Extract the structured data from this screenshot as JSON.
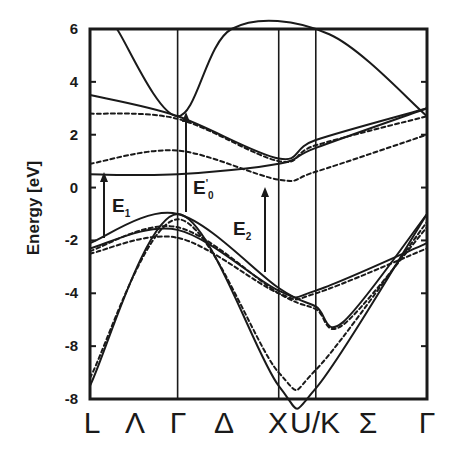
{
  "chart_data": {
    "type": "line",
    "title": "",
    "xlabel": "",
    "ylabel": "Energy  [eV]",
    "ylim": [
      -8,
      6
    ],
    "y_ticks": [
      6,
      4,
      2,
      0,
      -2,
      -4,
      -6,
      -8
    ],
    "y_tick_labels": [
      "6",
      "4",
      "2",
      "0",
      "-2",
      "-4",
      "-8",
      "-8"
    ],
    "x_tick_labels": [
      "L",
      "Λ",
      "Γ",
      "Δ",
      "X",
      "U/K",
      "Σ",
      "Γ"
    ],
    "high_symmetry_points": [
      {
        "label": "L",
        "x": 0.0
      },
      {
        "label": "Γ",
        "x": 0.26
      },
      {
        "label": "X",
        "x": 0.56
      },
      {
        "label": "U/K",
        "x": 0.67
      },
      {
        "label": "Γ",
        "x": 1.0
      }
    ],
    "grid": false,
    "legend": null,
    "line_styles": [
      "solid",
      "dashed"
    ],
    "annotations": [
      {
        "text": "E",
        "sub": "1",
        "sup": "",
        "note": "upward arrow transition near L-Λ, from about -2 to 0.6 eV"
      },
      {
        "text": "E",
        "sub": "0",
        "sup": "'",
        "note": "upward arrow transition at Γ, from about -1 to 2 eV"
      },
      {
        "text": "E",
        "sub": "2",
        "sup": "",
        "note": "upward arrow transition near Δ-X, from about -3.8 to 0.9 eV"
      }
    ],
    "series": [
      {
        "name": "valence band 1 (solid)",
        "style": "solid",
        "x": [
          0.0,
          0.26,
          0.56,
          0.67,
          1.0
        ],
        "values": [
          -7.5,
          -1.0,
          -7.5,
          -7.6,
          -1.0
        ]
      },
      {
        "name": "valence band 1 (dashed)",
        "style": "dashed",
        "x": [
          0.0,
          0.26,
          0.56,
          0.67,
          1.0
        ],
        "values": [
          -7.2,
          -1.2,
          -7.0,
          -6.9,
          -1.3
        ]
      },
      {
        "name": "valence band 2 (solid)",
        "style": "solid",
        "x": [
          0.0,
          0.26,
          0.56,
          0.67,
          0.75,
          1.0
        ],
        "values": [
          -2.1,
          -1.0,
          -3.8,
          -4.5,
          -5.1,
          -1.0
        ]
      },
      {
        "name": "valence band 2 (dashed)",
        "style": "dashed",
        "x": [
          0.0,
          0.26,
          0.56,
          0.67,
          0.75,
          1.0
        ],
        "values": [
          -2.4,
          -1.5,
          -4.0,
          -4.6,
          -5.2,
          -1.5
        ]
      },
      {
        "name": "valence band 3 (solid)",
        "style": "solid",
        "x": [
          0.0,
          0.26,
          0.56,
          0.67,
          1.0
        ],
        "values": [
          -2.3,
          -1.6,
          -3.9,
          -3.9,
          -2.1
        ]
      },
      {
        "name": "valence band 3 (dashed)",
        "style": "dashed",
        "x": [
          0.0,
          0.26,
          0.56,
          0.67,
          1.0
        ],
        "values": [
          -2.5,
          -1.9,
          -4.0,
          -4.0,
          -2.3
        ]
      },
      {
        "name": "conduction band 1 (solid)",
        "style": "solid",
        "x": [
          0.0,
          0.26,
          0.56,
          0.67,
          1.0
        ],
        "values": [
          0.5,
          0.5,
          0.9,
          1.5,
          3.0
        ]
      },
      {
        "name": "conduction band 1 (dashed)",
        "style": "dashed",
        "x": [
          0.0,
          0.26,
          0.56,
          0.67,
          1.0
        ],
        "values": [
          0.9,
          1.4,
          0.3,
          0.6,
          2.0
        ]
      },
      {
        "name": "conduction band 2 (solid)",
        "style": "solid",
        "x": [
          0.0,
          0.26,
          0.56,
          0.67,
          1.0
        ],
        "values": [
          3.5,
          2.7,
          1.1,
          1.8,
          3.0
        ]
      },
      {
        "name": "conduction band 2 (dashed)",
        "style": "dashed",
        "x": [
          0.0,
          0.26,
          0.56,
          0.67,
          1.0
        ],
        "values": [
          2.8,
          2.6,
          1.0,
          1.6,
          2.7
        ]
      },
      {
        "name": "conduction band 3 (solid)",
        "style": "solid",
        "x": [
          0.08,
          0.26,
          0.42,
          0.71,
          1.0
        ],
        "values": [
          6.0,
          2.7,
          6.0,
          5.8,
          2.7
        ]
      }
    ]
  }
}
